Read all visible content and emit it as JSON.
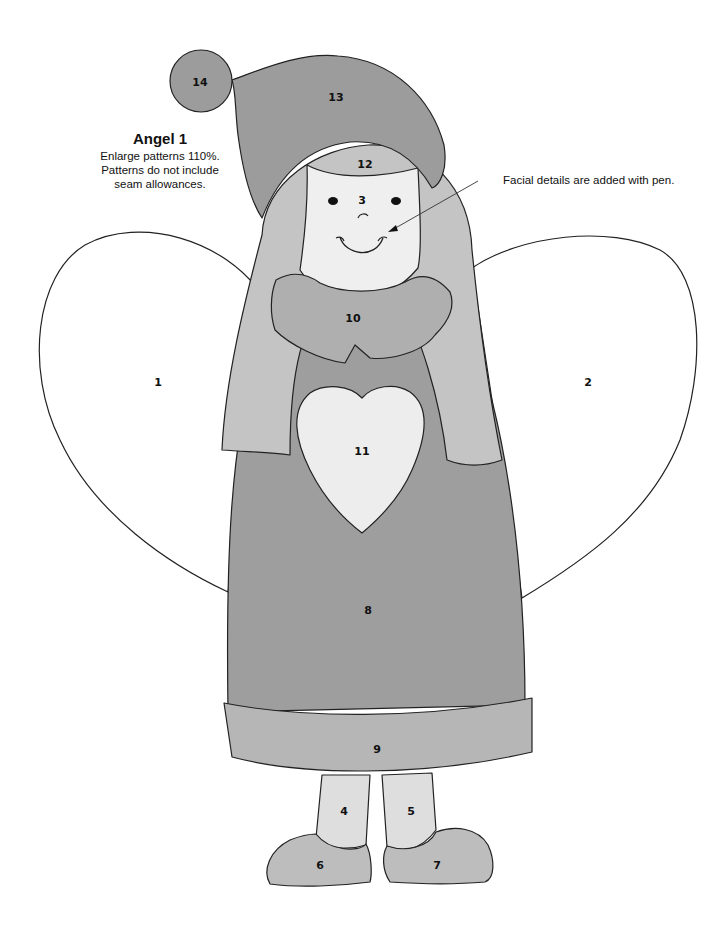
{
  "page": {
    "title": "Angel 1",
    "instructions": [
      "Enlarge patterns 110%.",
      "Patterns do not include",
      "seam allowances."
    ],
    "callout": "Facial details are added with pen."
  },
  "colors": {
    "background": "#ffffff",
    "wing": "#ffffff",
    "hat": "#9c9c9c",
    "pompom": "#9c9c9c",
    "hair": "#c4c4c4",
    "face": "#efefef",
    "collar": "#afafaf",
    "dress": "#9e9e9e",
    "heart": "#ededed",
    "hem": "#b6b6b6",
    "legs": "#dedede",
    "shoes": "#bdbdbd",
    "outline": "#222222"
  },
  "pieces": [
    {
      "id": "1",
      "name": "left wing"
    },
    {
      "id": "2",
      "name": "right wing"
    },
    {
      "id": "3",
      "name": "face"
    },
    {
      "id": "4",
      "name": "left leg"
    },
    {
      "id": "5",
      "name": "right leg"
    },
    {
      "id": "6",
      "name": "left shoe"
    },
    {
      "id": "7",
      "name": "right shoe"
    },
    {
      "id": "8",
      "name": "dress"
    },
    {
      "id": "9",
      "name": "dress hem"
    },
    {
      "id": "10",
      "name": "collar"
    },
    {
      "id": "11",
      "name": "heart"
    },
    {
      "id": "12",
      "name": "hair"
    },
    {
      "id": "13",
      "name": "hat"
    },
    {
      "id": "14",
      "name": "pompom"
    }
  ]
}
